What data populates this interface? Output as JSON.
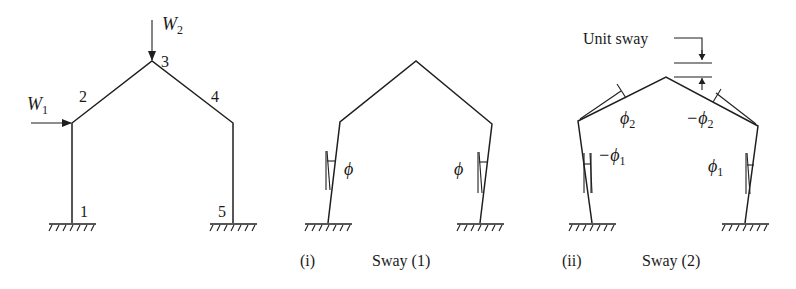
{
  "figure": {
    "panels": [
      {
        "id": "original-frame",
        "caption_index": "",
        "caption": "",
        "nodes": [
          {
            "label": "1",
            "x": 72,
            "y": 223
          },
          {
            "label": "2",
            "x": 72,
            "y": 123
          },
          {
            "label": "3",
            "x": 152,
            "y": 61
          },
          {
            "label": "4",
            "x": 233,
            "y": 123
          },
          {
            "label": "5",
            "x": 233,
            "y": 223
          }
        ],
        "loads": [
          {
            "name": "W",
            "sub": "1",
            "direction": "horizontal-right",
            "node": "2"
          },
          {
            "name": "W",
            "sub": "2",
            "direction": "vertical-down",
            "node": "3"
          }
        ]
      },
      {
        "id": "sway-1",
        "caption_index": "(i)",
        "caption": "Sway (1)",
        "rotations": [
          {
            "symbol": "ϕ",
            "member": "1-2"
          },
          {
            "symbol": "ϕ",
            "member": "4-5"
          }
        ]
      },
      {
        "id": "sway-2",
        "caption_index": "(ii)",
        "caption": "Sway (2)",
        "annotation": "Unit sway",
        "rotations": [
          {
            "symbol": "−ϕ",
            "sub": "1",
            "member": "1-2"
          },
          {
            "symbol": "ϕ",
            "sub": "2",
            "member": "2-3"
          },
          {
            "symbol": "−ϕ",
            "sub": "2",
            "member": "3-4"
          },
          {
            "symbol": "ϕ",
            "sub": "1",
            "member": "4-5"
          }
        ]
      }
    ],
    "labels": {
      "w1": "W",
      "w1_sub": "1",
      "w2": "W",
      "w2_sub": "2",
      "n1": "1",
      "n2": "2",
      "n3": "3",
      "n4": "4",
      "n5": "5",
      "phi": "ϕ",
      "minus_phi": "−ϕ",
      "sub1": "1",
      "sub2": "2",
      "cap1_index": "(i)",
      "cap1_text": "Sway (1)",
      "cap2_index": "(ii)",
      "cap2_text": "Sway (2)",
      "unit_sway": "Unit sway"
    }
  }
}
